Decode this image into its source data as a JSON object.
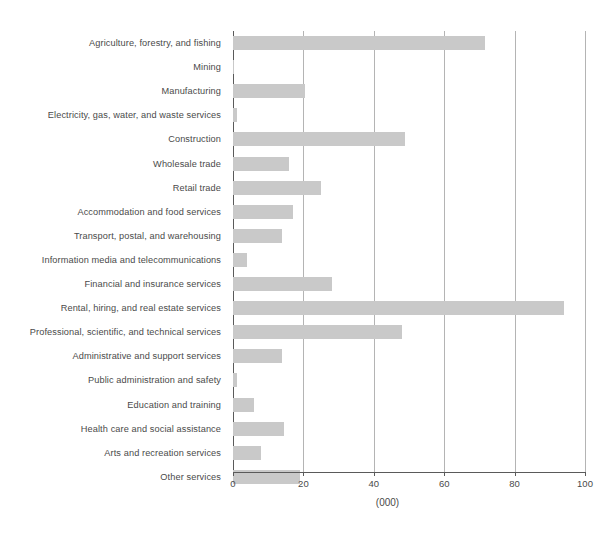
{
  "chart_data": {
    "type": "bar",
    "orientation": "horizontal",
    "title": "",
    "subtitle": "",
    "xlabel": "(000)",
    "ylabel": "",
    "xlim": [
      0,
      100
    ],
    "xticks": [
      0,
      20,
      40,
      60,
      80,
      100
    ],
    "xtick_labels": [
      "0",
      "20",
      "40",
      "60",
      "80",
      "100"
    ],
    "grid": true,
    "grid_axis": "x",
    "legend": false,
    "bar_color": "#c9c9c9",
    "axis_color": "#5a5a5a",
    "gridline_color": "#b4b4b4",
    "text_color": "#4a4a4a",
    "categories": [
      "Agriculture, forestry, and fishing",
      "Mining",
      "Manufacturing",
      "Electricity, gas, water, and waste services",
      "Construction",
      "Wholesale trade",
      "Retail trade",
      "Accommodation and food services",
      "Transport, postal, and warehousing",
      "Information media and telecommunications",
      "Financial and insurance services",
      "Rental, hiring, and real estate services",
      "Professional, scientific, and technical services",
      "Administrative and support services",
      "Public administration and safety",
      "Education and training",
      "Health care and social assistance",
      "Arts and recreation services",
      "Other services"
    ],
    "values": [
      71.6,
      0.4,
      20.5,
      1.0,
      49.0,
      16.0,
      25.0,
      17.0,
      14.0,
      4.0,
      28.0,
      94.0,
      48.0,
      14.0,
      1.0,
      6.0,
      14.5,
      8.0,
      19.0
    ]
  }
}
